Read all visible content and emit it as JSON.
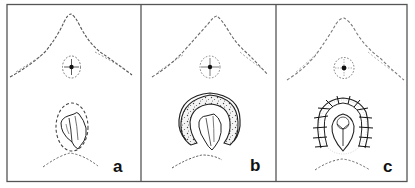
{
  "figure": {
    "panels": [
      {
        "id": "a",
        "label": "a",
        "stage": "excision-margin-marked"
      },
      {
        "id": "b",
        "label": "b",
        "stage": "tissue-excised"
      },
      {
        "id": "c",
        "label": "c",
        "stage": "wound-sutured"
      }
    ],
    "colors": {
      "frame": "#555555",
      "ink": "#1a1a1a",
      "dash": "#666666",
      "background": "#ffffff"
    }
  }
}
